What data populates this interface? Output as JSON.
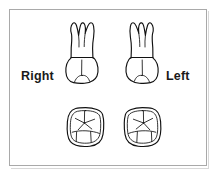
{
  "figure": {
    "frame": {
      "border_color": "#a9a9a9",
      "background_color": "#ffffff"
    },
    "labels": {
      "right": "Right",
      "left": "Left"
    },
    "ink_color": "#111111",
    "label_color": "#1a1a1a",
    "teeth": [
      {
        "id": "upper-right-buccal",
        "name": "Right maxillary molar buccal view",
        "view": "buccal",
        "side": "right",
        "roots": 3
      },
      {
        "id": "upper-left-buccal",
        "name": "Left maxillary molar buccal view",
        "view": "buccal",
        "side": "left",
        "roots": 3
      },
      {
        "id": "lower-right-occlusal",
        "name": "Right maxillary molar occlusal view",
        "view": "occlusal",
        "side": "right",
        "cusps": 4
      },
      {
        "id": "lower-left-occlusal",
        "name": "Left maxillary molar occlusal view",
        "view": "occlusal",
        "side": "left",
        "cusps": 4
      }
    ]
  }
}
